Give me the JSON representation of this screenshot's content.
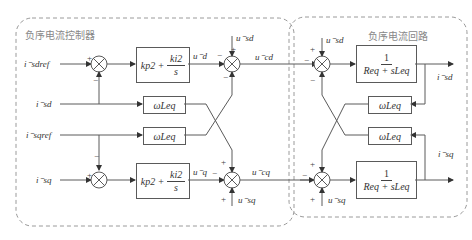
{
  "regions": {
    "controller_title": "负序电流控制器",
    "plant_title": "负序电流回路"
  },
  "inputs": {
    "isdref": "i⁻sdref",
    "isd": "i⁻sd",
    "isqref": "i⁻sqref",
    "isq": "i⁻sq"
  },
  "blocks": {
    "pi_d": {
      "kp": "kp2",
      "plus": "+",
      "ki_num": "ki2",
      "ki_den": "s"
    },
    "pi_q": {
      "kp": "kp2",
      "plus": "+",
      "ki_num": "ki2",
      "ki_den": "s"
    },
    "wl_ctrl_top": "ωLeq",
    "wl_ctrl_bottom": "ωLeq",
    "wl_plant_top": "ωLeq",
    "wl_plant_bottom": "ωLeq",
    "plant_d": {
      "num": "1",
      "den": "Req + sLeq"
    },
    "plant_q": {
      "num": "1",
      "den": "Req + sLeq"
    }
  },
  "signals": {
    "ud": "u⁻d",
    "uq": "u⁻q",
    "usd_ctrl": "u⁻sd",
    "usq_ctrl": "u⁻sq",
    "ucd": "u⁻cd",
    "ucq": "u⁻cq",
    "usd_plant": "u⁻sd",
    "usq_plant": "u⁻sq",
    "isd_out": "i⁻sd",
    "isq_out": "i⁻sq"
  },
  "signs": {
    "plus": "+",
    "minus": "−"
  }
}
